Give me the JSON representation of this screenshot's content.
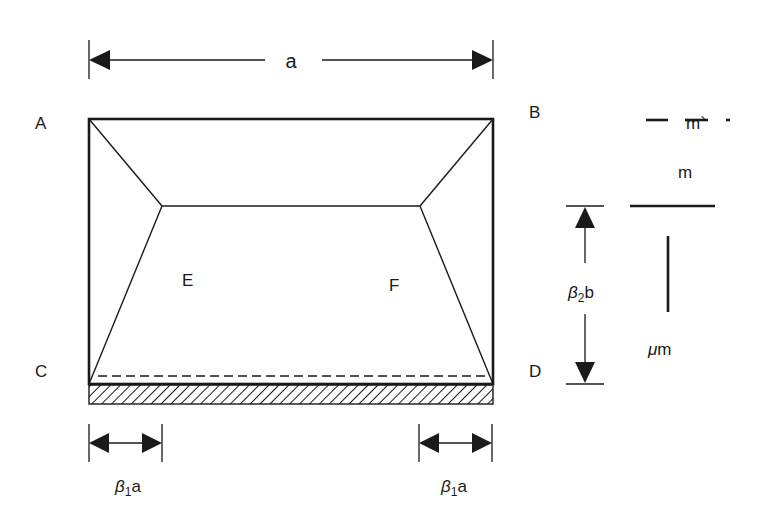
{
  "diagram": {
    "corners": {
      "A": "A",
      "B": "B",
      "C": "C",
      "D": "D"
    },
    "inner_points": {
      "E": "E",
      "F": "F"
    },
    "dimensions": {
      "top_width": "a",
      "left_offset": {
        "beta": "β",
        "sub": "1",
        "var": "a"
      },
      "right_offset": {
        "beta": "β",
        "sub": "1",
        "var": "a"
      },
      "height": {
        "beta": "β",
        "sub": "2",
        "var": "b"
      }
    },
    "legend": {
      "dashed_line_label": "m`",
      "solid_line_label": "m",
      "vertical_line_label": "μm"
    },
    "colors": {
      "stroke": "#1a1a1a",
      "background": "#ffffff"
    }
  }
}
